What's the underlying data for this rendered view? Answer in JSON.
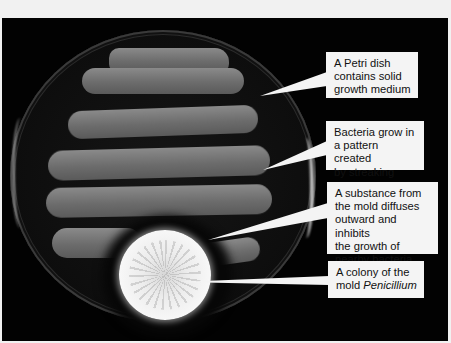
{
  "figure": {
    "colors": {
      "background": "#020202",
      "callout_fill": "#f4f4f4",
      "callout_text": "#111111",
      "bacteria": "#7a7a7a",
      "mold": "#f0f0f0"
    }
  },
  "callouts": [
    {
      "id": "petri-dish",
      "lines": [
        "A Petri dish",
        "contains solid",
        "growth medium"
      ]
    },
    {
      "id": "bacteria",
      "lines": [
        "Bacteria grow in",
        "a pattern created",
        "by streaking"
      ]
    },
    {
      "id": "inhibition",
      "lines": [
        "A substance from",
        "the mold diffuses",
        "outward and inhibits",
        "the growth of",
        "nearby bacteria"
      ]
    },
    {
      "id": "mold",
      "lines": [
        "A colony of the"
      ],
      "line2_prefix": "mold ",
      "line2_italic": "Penicillium"
    }
  ]
}
